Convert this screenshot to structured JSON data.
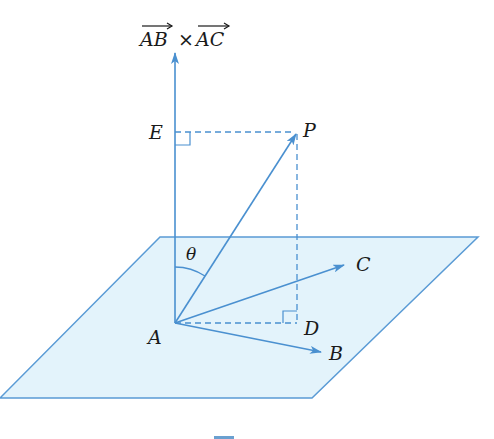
{
  "diagram": {
    "colors": {
      "line": "#4a90d0",
      "plane_fill": "#e3f3fb",
      "plane_edge": "#5a9bd5",
      "text": "#1a1a1a"
    },
    "labels": {
      "normal_vec_left": "AB",
      "cross": "×",
      "normal_vec_right": "AC",
      "E": "E",
      "P": "P",
      "theta": "θ",
      "C": "C",
      "A": "A",
      "D": "D",
      "B": "B"
    },
    "points": {
      "A": [
        175,
        323
      ],
      "P": [
        297,
        132
      ],
      "E": [
        175,
        132
      ],
      "D": [
        297,
        323
      ],
      "B": [
        322,
        352
      ],
      "C": [
        345,
        265
      ],
      "normal_tip": [
        175,
        52
      ]
    },
    "plane": [
      [
        160,
        237
      ],
      [
        478,
        237
      ],
      [
        312,
        398
      ],
      [
        0,
        398
      ]
    ]
  }
}
